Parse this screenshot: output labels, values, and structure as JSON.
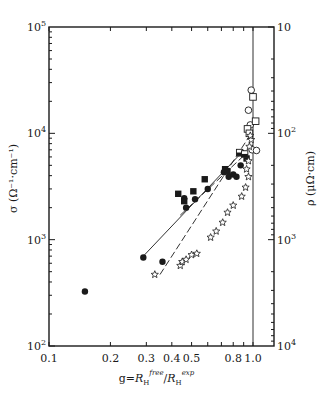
{
  "chart_data": {
    "type": "scatter",
    "title": "",
    "xlabel": "g=R_H^free/R_H^exp",
    "xlabel_parts": {
      "prefix": "g=",
      "num": "R",
      "num_sub": "H",
      "num_sup": "free",
      "slash": "/",
      "den": "R",
      "den_sub": "H",
      "den_sup": "exp"
    },
    "ylabel_left": "σ (Ω⁻¹·cm⁻¹)",
    "ylabel_right": "ρ (μΩ·cm)",
    "xscale": "log",
    "yscale": "log",
    "xlim": [
      0.1,
      1.27
    ],
    "ylim_left": [
      100,
      100000
    ],
    "ylim_right_inverted": [
      10,
      10000
    ],
    "x_ticks": [
      {
        "value": 0.1,
        "label": "0.1"
      },
      {
        "value": 0.2,
        "label": "0.2"
      },
      {
        "value": 0.3,
        "label": "0.3"
      },
      {
        "value": 0.4,
        "label": "0.4"
      },
      {
        "value": 0.5,
        "label": "0.5"
      },
      {
        "value": 0.6,
        "label": ""
      },
      {
        "value": 0.7,
        "label": ""
      },
      {
        "value": 0.8,
        "label": "0.8"
      },
      {
        "value": 0.9,
        "label": ""
      },
      {
        "value": 1.0,
        "label": "1.0"
      }
    ],
    "y_left_ticks": [
      {
        "value": 100,
        "base": "10",
        "exp": "2"
      },
      {
        "value": 1000,
        "base": "10",
        "exp": "3"
      },
      {
        "value": 10000,
        "base": "10",
        "exp": "4"
      },
      {
        "value": 100000,
        "base": "10",
        "exp": "5"
      }
    ],
    "y_right_ticks": [
      {
        "sigma": 100000,
        "label": "10",
        "exp": ""
      },
      {
        "sigma": 10000,
        "label": "10",
        "exp": "2"
      },
      {
        "sigma": 1000,
        "label": "10",
        "exp": "3"
      },
      {
        "sigma": 100,
        "label": "10",
        "exp": "4"
      }
    ],
    "grid": false,
    "legend": null,
    "series": [
      {
        "name": "filled-circles",
        "marker": "filled-circle",
        "points": [
          [
            0.15,
            325
          ],
          [
            0.29,
            680
          ],
          [
            0.36,
            620
          ],
          [
            0.46,
            2450
          ],
          [
            0.47,
            2000
          ],
          [
            0.52,
            2400
          ],
          [
            0.6,
            3000
          ],
          [
            0.72,
            4300
          ],
          [
            0.76,
            3900
          ],
          [
            0.8,
            4100
          ],
          [
            0.83,
            3900
          ],
          [
            0.87,
            5000
          ]
        ]
      },
      {
        "name": "filled-squares",
        "marker": "filled-square",
        "points": [
          [
            0.43,
            2700
          ],
          [
            0.46,
            2300
          ],
          [
            0.51,
            2850
          ],
          [
            0.58,
            3700
          ],
          [
            0.73,
            4600
          ],
          [
            0.75,
            4400
          ],
          [
            0.87,
            6500
          ],
          [
            0.93,
            5800
          ]
        ]
      },
      {
        "name": "half-filled-squares",
        "marker": "half-square",
        "points": [
          [
            0.86,
            6600
          ],
          [
            0.91,
            6400
          ]
        ]
      },
      {
        "name": "open-circles",
        "marker": "open-circle",
        "points": [
          [
            0.98,
            25500
          ],
          [
            0.95,
            16500
          ],
          [
            0.97,
            12000
          ],
          [
            0.99,
            7000
          ],
          [
            1.04,
            6900
          ]
        ]
      },
      {
        "name": "open-squares",
        "marker": "open-square",
        "points": [
          [
            1.0,
            22000
          ],
          [
            1.03,
            13000
          ],
          [
            0.94,
            11000
          ],
          [
            0.96,
            10000
          ]
        ]
      },
      {
        "name": "stars",
        "marker": "open-star",
        "points": [
          [
            0.33,
            470
          ],
          [
            0.44,
            570
          ],
          [
            0.45,
            620
          ],
          [
            0.47,
            650
          ],
          [
            0.5,
            720
          ],
          [
            0.53,
            740
          ],
          [
            0.62,
            1050
          ],
          [
            0.66,
            1200
          ],
          [
            0.71,
            1450
          ],
          [
            0.75,
            1800
          ],
          [
            0.8,
            2100
          ],
          [
            0.88,
            2550
          ],
          [
            0.92,
            3100
          ],
          [
            0.95,
            3900
          ],
          [
            0.93,
            4600
          ],
          [
            0.95,
            5500
          ],
          [
            0.96,
            7500
          ],
          [
            0.98,
            8700
          ],
          [
            0.97,
            9500
          ]
        ]
      }
    ],
    "lines": [
      {
        "name": "upper-line",
        "style": "solid",
        "from": [
          0.29,
          700
        ],
        "to": [
          0.88,
          6600
        ]
      },
      {
        "name": "middle-line",
        "style": "dashed",
        "from": [
          0.44,
          1700
        ],
        "to": [
          0.92,
          6400
        ]
      },
      {
        "name": "star-line",
        "style": "dashed",
        "from": [
          0.35,
          470
        ],
        "to": [
          0.98,
          10000
        ]
      },
      {
        "name": "g-equals-1-line",
        "style": "solid",
        "from": [
          1.0,
          100
        ],
        "to": [
          1.0,
          100000
        ]
      }
    ]
  }
}
